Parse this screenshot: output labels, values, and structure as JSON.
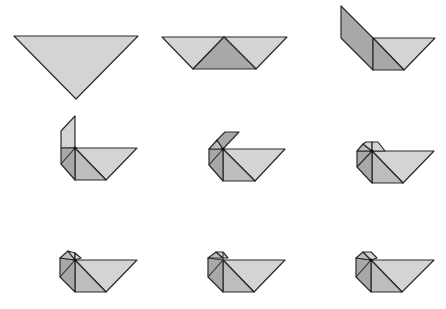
{
  "diagram": {
    "title": "",
    "type": "origami folding sequence",
    "layout": {
      "rows": 3,
      "columns": 3
    },
    "colors": {
      "background": "#ffffff",
      "light_face": "#d4d4d4",
      "mid_face": "#bdbdbd",
      "dark_face": "#a8a8a8",
      "edge": "#2a2a2a"
    },
    "steps": [
      {
        "index": 1,
        "label": "",
        "description": "inverted triangle"
      },
      {
        "index": 2,
        "label": "",
        "description": "trapezoid with centre dark triangle"
      },
      {
        "index": 3,
        "label": "",
        "description": "left flap folded up"
      },
      {
        "index": 4,
        "label": "",
        "description": "neck folded vertical"
      },
      {
        "index": 5,
        "label": "",
        "description": "head flap folded"
      },
      {
        "index": 6,
        "label": "",
        "description": "head folded further"
      },
      {
        "index": 7,
        "label": "",
        "description": "rounded head"
      },
      {
        "index": 8,
        "label": "",
        "description": "rounded head variant"
      },
      {
        "index": 9,
        "label": "",
        "description": "finished shape"
      }
    ]
  }
}
